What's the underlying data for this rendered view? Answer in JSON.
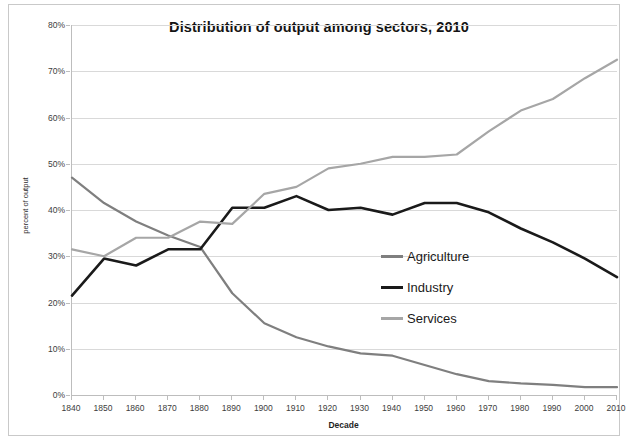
{
  "chart_data": {
    "type": "line",
    "title": "Distribution of output among sectors, 2010",
    "xlabel": "Decade",
    "ylabel": "percent of output",
    "grid": true,
    "legend_position": "inside-center-right",
    "xlim": [
      1840,
      2010
    ],
    "ylim": [
      0,
      80
    ],
    "ytick_labels": [
      "80%",
      "70%",
      "60%",
      "50%",
      "40%",
      "30%",
      "20%",
      "10%",
      "0%"
    ],
    "ytick_values": [
      80,
      70,
      60,
      50,
      40,
      30,
      20,
      10,
      0
    ],
    "categories": [
      1840,
      1850,
      1860,
      1870,
      1880,
      1890,
      1900,
      1910,
      1920,
      1930,
      1940,
      1950,
      1960,
      1970,
      1980,
      1990,
      2000,
      2010
    ],
    "xtick_labels": [
      "1840",
      "1850",
      "1860",
      "1870",
      "1880",
      "1890",
      "1900",
      "1910",
      "1920",
      "1930",
      "1940",
      "1950",
      "1960",
      "1970",
      "1980",
      "1990",
      "2000",
      "2010"
    ],
    "series": [
      {
        "name": "Agriculture",
        "color": "#7f7f7f",
        "values": [
          47,
          41.5,
          37.5,
          34.5,
          32,
          22,
          15.5,
          12.5,
          10.5,
          9,
          8.5,
          6.5,
          4.5,
          3,
          2.5,
          2.2,
          1.7,
          1.7
        ]
      },
      {
        "name": "Industry",
        "color": "#1a1a1a",
        "values": [
          21.5,
          29.5,
          28,
          31.5,
          31.5,
          40.5,
          40.5,
          43,
          40,
          40.5,
          39,
          41.5,
          41.5,
          39.5,
          36,
          33,
          29.5,
          25.5
        ]
      },
      {
        "name": "Services",
        "color": "#a6a6a6",
        "values": [
          31.5,
          30,
          34,
          34,
          37.5,
          37,
          43.5,
          45,
          49,
          50,
          51.5,
          51.5,
          52,
          57,
          61.5,
          64,
          68.5,
          72.5
        ]
      }
    ]
  },
  "legend": {
    "items": [
      {
        "label": "Agriculture",
        "color": "#7f7f7f"
      },
      {
        "label": "Industry",
        "color": "#1a1a1a"
      },
      {
        "label": "Services",
        "color": "#a6a6a6"
      }
    ]
  }
}
